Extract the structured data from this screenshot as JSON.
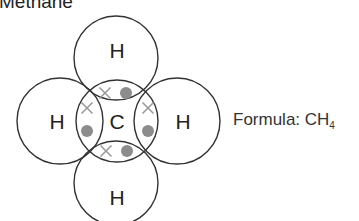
{
  "title": "Methane",
  "formula": {
    "label": "Formula: CH",
    "subscript": "4"
  },
  "colors": {
    "outline": "#333333",
    "cross": "#9a9a9a",
    "dot": "#8c8c8c",
    "text": "#222222"
  },
  "atoms": {
    "center": {
      "symbol": "C",
      "cx": 117,
      "cy": 121,
      "r": 41
    },
    "top": {
      "symbol": "H",
      "cx": 116,
      "cy": 58,
      "r": 42
    },
    "bottom": {
      "symbol": "H",
      "cx": 116,
      "cy": 183,
      "r": 42
    },
    "left": {
      "symbol": "H",
      "cx": 60,
      "cy": 121,
      "r": 43
    },
    "right": {
      "symbol": "H",
      "cx": 177,
      "cy": 121,
      "r": 43
    }
  },
  "bonds": [
    {
      "name": "top",
      "cross": [
        105,
        93
      ],
      "dot": [
        126,
        93
      ]
    },
    {
      "name": "bottom",
      "cross": [
        106,
        151
      ],
      "dot": [
        127,
        151
      ]
    },
    {
      "name": "left",
      "cross": [
        87,
        108
      ],
      "dot": [
        87,
        131
      ]
    },
    {
      "name": "right",
      "cross": [
        148,
        108
      ],
      "dot": [
        148,
        131
      ]
    }
  ]
}
